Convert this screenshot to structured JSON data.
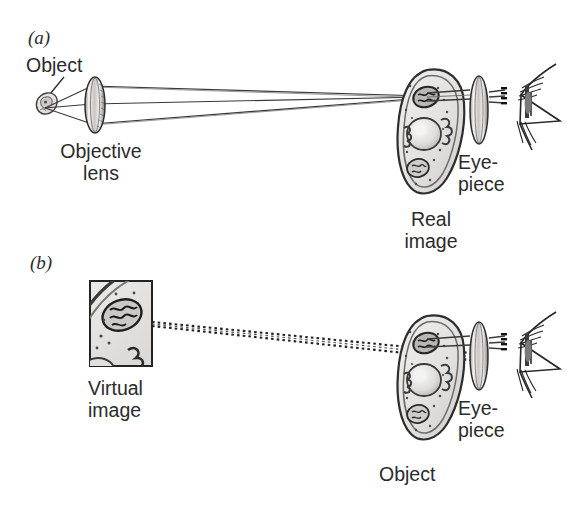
{
  "figure": {
    "type": "optical-ray-diagram",
    "background_color": "#ffffff",
    "ink_color": "#231f20",
    "panels": [
      {
        "id": "a",
        "panel_label": "(a)",
        "caption_labels": [
          {
            "name": "object",
            "text": "Object"
          },
          {
            "name": "objective-lens",
            "text": "Objective\nlens",
            "line1": "Objective",
            "line2": "lens"
          },
          {
            "name": "eyepiece",
            "text": "Eye-\npiece",
            "line1": "Eye-",
            "line2": "piece"
          },
          {
            "name": "real-image",
            "text": "Real\nimage",
            "line1": "Real",
            "line2": "image"
          }
        ],
        "ray_style": "solid",
        "ray_count": 3,
        "elements": [
          "small-specimen",
          "objective-lens",
          "magnified-cell",
          "eyepiece-lens",
          "eye"
        ]
      },
      {
        "id": "b",
        "panel_label": "(b)",
        "caption_labels": [
          {
            "name": "virtual-image",
            "text": "Virtual\nimage",
            "line1": "Virtual",
            "line2": "image"
          },
          {
            "name": "eyepiece",
            "text": "Eye-\npiece",
            "line1": "Eye-",
            "line2": "piece"
          },
          {
            "name": "object",
            "text": "Object"
          }
        ],
        "ray_style": "dotted",
        "ray_count": 2,
        "elements": [
          "virtual-image-frame",
          "magnified-cell",
          "eyepiece-lens",
          "eye"
        ]
      }
    ],
    "colors": {
      "cell_fill": "#e8e6e4",
      "cell_outline": "#3a3a3a",
      "nucleus_fill": "#d9d7d5",
      "lens_fill": "#dedbd8",
      "lens_edge": "#2f2f2f",
      "frame_stroke": "#232323"
    }
  }
}
